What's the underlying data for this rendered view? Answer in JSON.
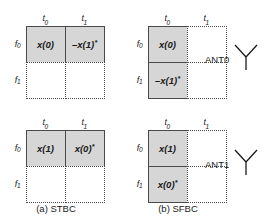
{
  "figure": {
    "axes": {
      "time_labels": [
        "t",
        "t"
      ],
      "time_subscripts": [
        "0",
        "1"
      ],
      "freq_labels": [
        "f",
        "f"
      ],
      "freq_subscripts": [
        "0",
        "1"
      ]
    },
    "shade_color": "#d6d6d6",
    "border_color": "#4a4a4a"
  },
  "blocks": {
    "stbc_ant0": {
      "scheme": "STBC",
      "antenna": "ANT0",
      "columns": [
        {
          "label": "t",
          "sub": "0"
        },
        {
          "label": "t",
          "sub": "1"
        }
      ],
      "rows": [
        {
          "label": "f",
          "sub": "0"
        },
        {
          "label": "f",
          "sub": "1"
        }
      ],
      "cells": [
        {
          "value": "x(0)",
          "conj": "",
          "filled": true
        },
        {
          "value": "–x(1)",
          "conj": "*",
          "filled": true
        },
        {
          "value": "",
          "conj": "",
          "filled": false
        },
        {
          "value": "",
          "conj": "",
          "filled": false
        }
      ]
    },
    "sfbc_ant0": {
      "scheme": "SFBC",
      "antenna": "ANT0",
      "columns": [
        {
          "label": "t",
          "sub": "0"
        },
        {
          "label": "t",
          "sub": "1"
        }
      ],
      "rows": [
        {
          "label": "f",
          "sub": "0"
        },
        {
          "label": "f",
          "sub": "1"
        }
      ],
      "cells": [
        {
          "value": "x(0)",
          "conj": "",
          "filled": true
        },
        {
          "value": "",
          "conj": "",
          "filled": false
        },
        {
          "value": "–x(1)",
          "conj": "*",
          "filled": true
        },
        {
          "value": "",
          "conj": "",
          "filled": false
        }
      ]
    },
    "stbc_ant1": {
      "scheme": "STBC",
      "antenna": "ANT1",
      "columns": [
        {
          "label": "t",
          "sub": "0"
        },
        {
          "label": "t",
          "sub": "1"
        }
      ],
      "rows": [
        {
          "label": "f",
          "sub": "0"
        },
        {
          "label": "f",
          "sub": "1"
        }
      ],
      "cells": [
        {
          "value": "x(1)",
          "conj": "",
          "filled": true
        },
        {
          "value": "x(0)",
          "conj": "*",
          "filled": true
        },
        {
          "value": "",
          "conj": "",
          "filled": false
        },
        {
          "value": "",
          "conj": "",
          "filled": false
        }
      ]
    },
    "sfbc_ant1": {
      "scheme": "SFBC",
      "antenna": "ANT1",
      "columns": [
        {
          "label": "t",
          "sub": "0"
        },
        {
          "label": "t",
          "sub": "1"
        }
      ],
      "rows": [
        {
          "label": "f",
          "sub": "0"
        },
        {
          "label": "f",
          "sub": "1"
        }
      ],
      "cells": [
        {
          "value": "x(1)",
          "conj": "",
          "filled": true
        },
        {
          "value": "",
          "conj": "",
          "filled": false
        },
        {
          "value": "x(0)",
          "conj": "*",
          "filled": true
        },
        {
          "value": "",
          "conj": "",
          "filled": false
        }
      ]
    }
  },
  "captions": {
    "a": "(a) STBC",
    "b": "(b) SFBC"
  },
  "antennas": [
    {
      "label": "ANT0",
      "icon": "antenna-icon"
    },
    {
      "label": "ANT1",
      "icon": "antenna-icon"
    }
  ]
}
